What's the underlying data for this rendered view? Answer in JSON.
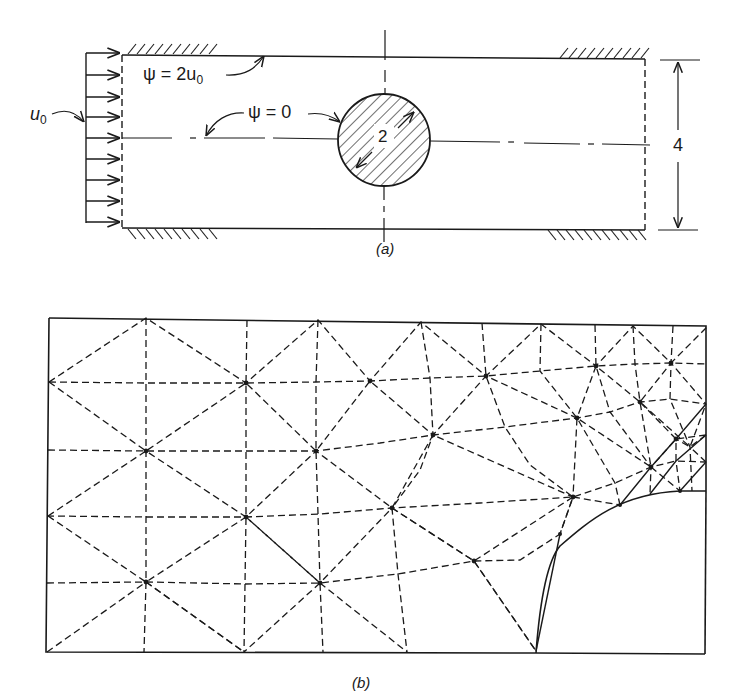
{
  "figure_a": {
    "caption": "(a)",
    "inlet_velocity_label": "u",
    "inlet_velocity_sub": "0",
    "top_wall_psi_label": "ψ = 2u",
    "top_wall_psi_sub": "0",
    "centerline_psi_label": "ψ = 0",
    "cylinder_diameter_label": "2",
    "channel_height_label": "4",
    "geometry": {
      "channel_left": 122,
      "channel_right": 645,
      "channel_top": 55,
      "channel_bottom": 228,
      "inlet_arrow_tail_x": 85,
      "centerline_y": 140,
      "cylinder_center": [
        384,
        140
      ],
      "cylinder_radius": 46,
      "dim_x": 680,
      "dim_top": 60,
      "dim_bottom": 230
    },
    "inlet_arrow_ys": [
      55,
      75,
      97,
      117,
      138,
      159,
      181,
      201,
      222
    ]
  },
  "figure_b": {
    "caption": "(b)",
    "frame": {
      "left": 48,
      "right": 708,
      "top": 318,
      "bottom": 652
    },
    "cylinder_arc": {
      "center": [
        708,
        652
      ],
      "radius": 172
    },
    "nodes_vertex": [
      [
        146,
        318
      ],
      [
        247,
        320
      ],
      [
        318,
        320
      ],
      [
        421,
        322
      ],
      [
        482,
        323
      ],
      [
        541,
        324
      ],
      [
        595,
        325
      ],
      [
        633,
        326
      ],
      [
        673,
        326
      ],
      [
        708,
        326
      ],
      [
        48,
        382
      ],
      [
        708,
        404
      ],
      [
        48,
        516
      ],
      [
        48,
        652
      ],
      [
        146,
        652
      ],
      [
        244,
        652
      ],
      [
        325,
        652
      ],
      [
        407,
        652
      ],
      [
        536,
        651
      ]
    ],
    "star_nodes": [
      [
        246,
        383
      ],
      [
        370,
        381
      ],
      [
        486,
        376
      ],
      [
        596,
        366
      ],
      [
        671,
        363
      ],
      [
        640,
        402
      ],
      [
        700,
        394
      ],
      [
        146,
        451
      ],
      [
        316,
        451
      ],
      [
        433,
        435
      ],
      [
        577,
        418
      ],
      [
        708,
        435
      ],
      [
        676,
        439
      ],
      [
        246,
        517
      ],
      [
        392,
        508
      ],
      [
        573,
        497
      ],
      [
        651,
        467
      ],
      [
        690,
        447
      ],
      [
        146,
        582
      ],
      [
        320,
        583
      ],
      [
        474,
        561
      ],
      [
        560,
        534
      ],
      [
        680,
        491
      ]
    ]
  }
}
